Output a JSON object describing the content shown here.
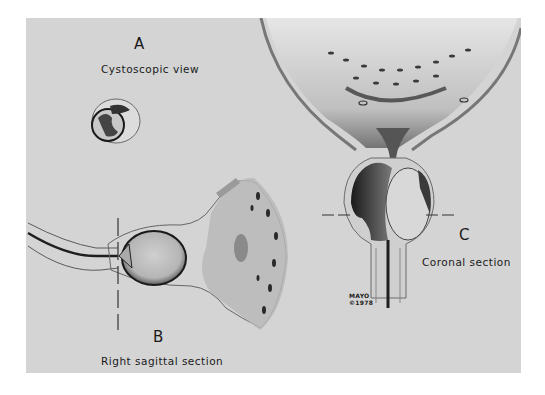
{
  "figure": {
    "background_color": "#d4d4d4",
    "panels": [
      {
        "id": "A",
        "letter": "A",
        "caption": "Cystoscopic view"
      },
      {
        "id": "B",
        "letter": "B",
        "caption": "Right sagittal section"
      },
      {
        "id": "C",
        "letter": "C",
        "caption": "Coronal section"
      }
    ],
    "signature": {
      "line1": "MAYO",
      "line2": "©1978"
    }
  }
}
